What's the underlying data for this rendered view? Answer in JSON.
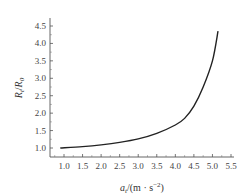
{
  "chart_data": {
    "type": "line",
    "title": "",
    "xlabel": "a_t/(m · s^-2)",
    "ylabel": "R_t/R_0",
    "xlabel_parts": {
      "var": "a",
      "sub": "t",
      "unit": "/(m · s",
      "sup": "−2",
      "close": ")"
    },
    "ylabel_parts": {
      "var1": "R",
      "sub1": "t",
      "slash": "/",
      "var2": "R",
      "sub2": "0"
    },
    "xlim": [
      0.8,
      5.6
    ],
    "ylim": [
      0.85,
      4.75
    ],
    "x_ticks": [
      "1.0",
      "1.5",
      "2.0",
      "2.5",
      "3.0",
      "3.5",
      "4.0",
      "4.5",
      "5.0",
      "5.5"
    ],
    "y_ticks": [
      "1.0",
      "1.5",
      "2.0",
      "2.5",
      "3.0",
      "3.5",
      "4.0",
      "4.5"
    ],
    "grid": false,
    "legend": null,
    "series": [
      {
        "name": "R_t/R_0",
        "color": "#222222",
        "x": [
          0.9,
          1.5,
          2.0,
          2.5,
          3.0,
          3.5,
          4.0,
          4.25,
          4.5,
          4.75,
          5.0,
          5.15
        ],
        "y": [
          1.0,
          1.04,
          1.09,
          1.16,
          1.26,
          1.42,
          1.66,
          1.85,
          2.2,
          2.75,
          3.5,
          4.35
        ]
      }
    ]
  }
}
